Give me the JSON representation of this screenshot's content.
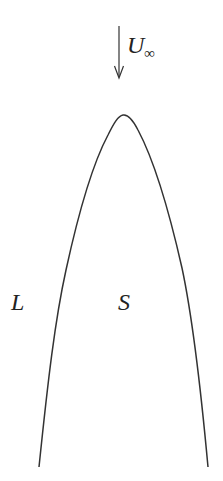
{
  "diagram": {
    "freestream": {
      "symbol": "U",
      "subscript": "∞",
      "direction": "down"
    },
    "regions": [
      {
        "id": "L",
        "label": "L"
      },
      {
        "id": "S",
        "label": "S"
      }
    ],
    "colors": {
      "stroke": "#333333",
      "text": "#222222",
      "background": "#ffffff"
    }
  }
}
